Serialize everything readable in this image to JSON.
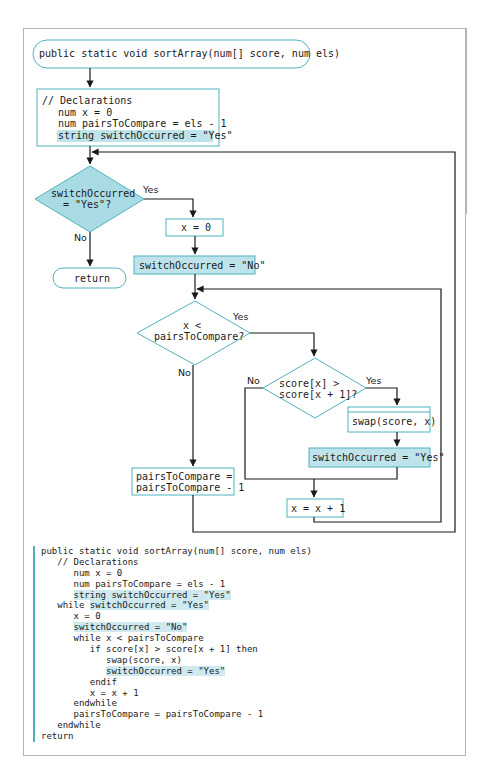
{
  "colors": {
    "accent_border": "#4fb3bf",
    "highlight_fill": "#bfe3ea",
    "decision_fill": "#a9dbe5",
    "line": "#1a1a1a",
    "frame": "#b5b5b5"
  },
  "flowchart": {
    "start": "public static void sortArray(num[] score, num els)",
    "declarations": {
      "comment": "// Declarations",
      "line1": "num x = 0",
      "line2": "num pairsToCompare = els - 1",
      "line3": "string switchOccurred = \"Yes\""
    },
    "decision_outer": {
      "line1": "switchOccurred",
      "line2": "= \"Yes\"?",
      "yes": "Yes",
      "no": "No"
    },
    "end": "return",
    "set_x": "x = 0",
    "set_switch_no": "switchOccurred = \"No\"",
    "decision_mid": {
      "line1": "x <",
      "line2": "pairsToCompare?",
      "yes": "Yes",
      "no": "No"
    },
    "decision_inner": {
      "line1": "score[x] >",
      "line2": "score[x + 1]?",
      "yes": "Yes",
      "no": "No"
    },
    "swap": "swap(score, x)",
    "set_switch_yes": "switchOccurred = \"Yes\"",
    "decrement": {
      "line1": "pairsToCompare =",
      "line2": "pairsToCompare - 1"
    },
    "increment": "x = x + 1"
  },
  "pseudocode": {
    "lines": [
      {
        "indent": "",
        "text": "public static void sortArray(num[] score, num els)",
        "hl": ""
      },
      {
        "indent": "   ",
        "text": "// Declarations",
        "hl": ""
      },
      {
        "indent": "      ",
        "text": "num x = 0",
        "hl": ""
      },
      {
        "indent": "      ",
        "text": "num pairsToCompare = els - 1",
        "hl": ""
      },
      {
        "indent": "      ",
        "text": "",
        "hl": "string switchOccurred = \"Yes\""
      },
      {
        "indent": "   ",
        "text": "while ",
        "hl": "switchOccurred = \"Yes\""
      },
      {
        "indent": "      ",
        "text": "x = 0",
        "hl": ""
      },
      {
        "indent": "      ",
        "text": "",
        "hl": "switchOccurred = \"No\""
      },
      {
        "indent": "      ",
        "text": "while x < pairsToCompare",
        "hl": ""
      },
      {
        "indent": "         ",
        "text": "if score[x] > score[x + 1] then",
        "hl": ""
      },
      {
        "indent": "            ",
        "text": "swap(score, x)",
        "hl": ""
      },
      {
        "indent": "            ",
        "text": "",
        "hl": "switchOccurred = \"Yes\""
      },
      {
        "indent": "         ",
        "text": "endif",
        "hl": ""
      },
      {
        "indent": "         ",
        "text": "x = x + 1",
        "hl": ""
      },
      {
        "indent": "      ",
        "text": "endwhile",
        "hl": ""
      },
      {
        "indent": "      ",
        "text": "pairsToCompare = pairsToCompare - 1",
        "hl": ""
      },
      {
        "indent": "   ",
        "text": "endwhile",
        "hl": ""
      },
      {
        "indent": "",
        "text": "return",
        "hl": ""
      }
    ]
  }
}
